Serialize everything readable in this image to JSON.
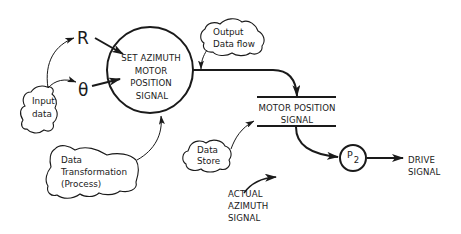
{
  "diagram": {
    "type": "data-flow-diagram",
    "process_main": {
      "lines": [
        "SET AZIMUTH",
        "MOTOR",
        "POSITION",
        "SIGNAL"
      ]
    },
    "inputs": {
      "r_label": "R",
      "theta_label": "θ"
    },
    "data_store": {
      "lines": [
        "MOTOR POSITION",
        "SIGNAL"
      ]
    },
    "process_p2": {
      "label": "P",
      "subscript": "2"
    },
    "output": {
      "lines": [
        "DRIVE",
        "SIGNAL"
      ]
    },
    "actual_signal": {
      "lines": [
        "ACTUAL",
        "AZIMUTH",
        "SIGNAL"
      ]
    },
    "annotations": {
      "input_data": [
        "Input",
        "data"
      ],
      "output_data_flow": [
        "Output",
        "Data flow"
      ],
      "data_store": [
        "Data",
        "Store"
      ],
      "data_transformation": [
        "Data",
        "Transformation",
        "(Process)"
      ]
    },
    "colors": {
      "stroke": "#1a1a1a",
      "background": "#ffffff"
    }
  }
}
